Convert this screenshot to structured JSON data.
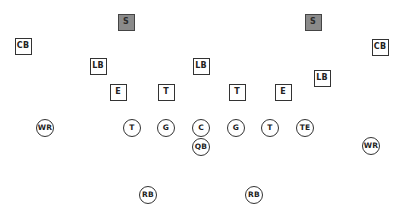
{
  "diagram": {
    "type": "football-formation",
    "defense": [
      {
        "id": "s-left",
        "label": "S",
        "x": 126,
        "y": 22,
        "shaded": true
      },
      {
        "id": "s-right",
        "label": "S",
        "x": 313,
        "y": 22,
        "shaded": true
      },
      {
        "id": "cb-left",
        "label": "CB",
        "x": 23,
        "y": 46,
        "shaded": false
      },
      {
        "id": "cb-right",
        "label": "CB",
        "x": 380,
        "y": 47,
        "shaded": false
      },
      {
        "id": "lb-left",
        "label": "LB",
        "x": 98,
        "y": 66,
        "shaded": false
      },
      {
        "id": "lb-mid",
        "label": "LB",
        "x": 201,
        "y": 66,
        "shaded": false
      },
      {
        "id": "lb-right",
        "label": "LB",
        "x": 322,
        "y": 78,
        "shaded": false
      },
      {
        "id": "e-left",
        "label": "E",
        "x": 118,
        "y": 92,
        "shaded": false
      },
      {
        "id": "t-left",
        "label": "T",
        "x": 166,
        "y": 92,
        "shaded": false
      },
      {
        "id": "t-right",
        "label": "T",
        "x": 237,
        "y": 92,
        "shaded": false
      },
      {
        "id": "e-right",
        "label": "E",
        "x": 283,
        "y": 92,
        "shaded": false
      }
    ],
    "offense": [
      {
        "id": "wr-left",
        "label": "WR",
        "x": 45,
        "y": 128
      },
      {
        "id": "t-left",
        "label": "T",
        "x": 132,
        "y": 128
      },
      {
        "id": "g-left",
        "label": "G",
        "x": 166,
        "y": 128
      },
      {
        "id": "c",
        "label": "C",
        "x": 201,
        "y": 128
      },
      {
        "id": "g-right",
        "label": "G",
        "x": 236,
        "y": 128
      },
      {
        "id": "t-right",
        "label": "T",
        "x": 270,
        "y": 128
      },
      {
        "id": "te",
        "label": "TE",
        "x": 305,
        "y": 128
      },
      {
        "id": "qb",
        "label": "QB",
        "x": 201,
        "y": 147
      },
      {
        "id": "wr-right",
        "label": "WR",
        "x": 371,
        "y": 146
      },
      {
        "id": "rb-left",
        "label": "RB",
        "x": 148,
        "y": 195
      },
      {
        "id": "rb-right",
        "label": "RB",
        "x": 254,
        "y": 195
      }
    ],
    "colors": {
      "safety_fill": "#8a8a8a",
      "stroke": "#333333",
      "background": "#ffffff"
    }
  }
}
